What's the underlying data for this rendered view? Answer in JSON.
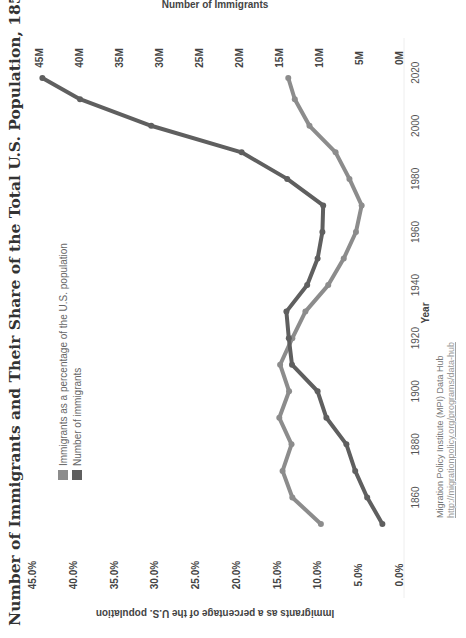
{
  "chart_data": {
    "type": "line",
    "title": "Number of Immigrants and Their Share of the Total U.S. Population, 1850-2018",
    "xlabel": "Year",
    "ylabel_left": "Immigrants as a percentage of the U.S. population",
    "ylabel_right": "Number of Immigrants",
    "x": [
      1850,
      1860,
      1870,
      1880,
      1890,
      1900,
      1910,
      1920,
      1930,
      1940,
      1950,
      1960,
      1970,
      1980,
      1990,
      2000,
      2010,
      2018
    ],
    "x_ticks": [
      "1860",
      "1880",
      "1900",
      "1920",
      "1940",
      "1960",
      "1980",
      "2000",
      "2020"
    ],
    "x_tick_values": [
      1860,
      1880,
      1900,
      1920,
      1940,
      1960,
      1980,
      2000,
      2020
    ],
    "xlim": [
      1850,
      2020
    ],
    "ylim_left": [
      0,
      45
    ],
    "ylim_right": [
      0,
      45
    ],
    "y_ticks_left": [
      "0.0%",
      "5.0%",
      "10.0%",
      "15.0%",
      "20.0%",
      "25.0%",
      "30.0%",
      "35.0%",
      "40.0%",
      "45.0%"
    ],
    "y_ticks_right": [
      "0M",
      "5M",
      "10M",
      "15M",
      "20M",
      "25M",
      "30M",
      "35M",
      "40M",
      "45M"
    ],
    "series": [
      {
        "name": "Immigrants as a percentage of the U.S. population",
        "axis": "left",
        "unit": "%",
        "color": "#8c8c8c",
        "values": [
          9.7,
          13.2,
          14.4,
          13.3,
          14.8,
          13.6,
          14.7,
          13.2,
          11.6,
          8.8,
          6.9,
          5.4,
          4.7,
          6.2,
          7.9,
          11.1,
          12.9,
          13.7
        ]
      },
      {
        "name": "Number of immigrants",
        "axis": "right",
        "unit": "millions",
        "color": "#5f5f5f",
        "values": [
          2.2,
          4.1,
          5.6,
          6.7,
          9.2,
          10.3,
          13.5,
          13.9,
          14.2,
          11.6,
          10.3,
          9.7,
          9.6,
          14.1,
          19.8,
          31.1,
          40.0,
          44.7
        ]
      }
    ],
    "legend": [
      "Immigrants as a percentage of the U.S. population",
      "Number of immigrants"
    ],
    "legend_position": "top-left",
    "grid": false,
    "orientation": "rotated 90 degrees counter-clockwise"
  },
  "source": {
    "line1": "Migration Policy Institute (MPI) Data Hub",
    "line2": "http://migrationpolicy.org/programs/data-hub"
  }
}
